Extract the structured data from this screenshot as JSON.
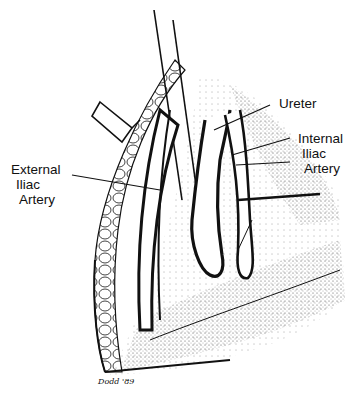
{
  "figure": {
    "labels": {
      "ureter": "Ureter",
      "internal_iliac": [
        "Internal",
        "Iliac",
        "Artery"
      ],
      "external_iliac": [
        "External",
        "Iliac",
        "Artery"
      ]
    },
    "signature": "Dodd '89",
    "colors": {
      "ink": "#111111",
      "background": "#ffffff",
      "stipple": "#555555"
    }
  }
}
